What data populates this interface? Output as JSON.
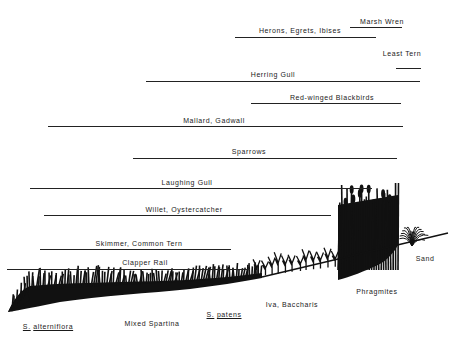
{
  "title": "",
  "birds": [
    {
      "name": "Marsh Wren",
      "x1": 350,
      "x2": 402,
      "y": 27,
      "label_x": 382,
      "label_y": 18
    },
    {
      "name": "Herons, Egrets, Ibises",
      "x1": 235,
      "x2": 376,
      "y": 37,
      "label_x": 300,
      "label_y": 27
    },
    {
      "name": "Least Tern",
      "x1": 396,
      "x2": 421,
      "y": 68,
      "label_x": 402,
      "label_y": 50
    },
    {
      "name": "Herring Gull",
      "x1": 146,
      "x2": 420,
      "y": 81,
      "label_x": 273,
      "label_y": 71
    },
    {
      "name": "Red-winged Blackbirds",
      "x1": 251,
      "x2": 401,
      "y": 103,
      "label_x": 332,
      "label_y": 94
    },
    {
      "name": "Mallard, Gadwall",
      "x1": 48,
      "x2": 403,
      "y": 126,
      "label_x": 214,
      "label_y": 117
    },
    {
      "name": "Sparrows",
      "x1": 133,
      "x2": 397,
      "y": 158,
      "label_x": 249,
      "label_y": 148
    },
    {
      "name": "Laughing Gull",
      "x1": 30,
      "x2": 372,
      "y": 188,
      "label_x": 187,
      "label_y": 179
    },
    {
      "name": "Willet, Oystercatcher",
      "x1": 44,
      "x2": 331,
      "y": 215,
      "label_x": 184,
      "label_y": 206
    },
    {
      "name": "Skimmer, Common Tern",
      "x1": 40,
      "x2": 231,
      "y": 249,
      "label_x": 139,
      "label_y": 240
    },
    {
      "name": "Clapper Rail",
      "x1": 7,
      "x2": 250,
      "y": 269,
      "label_x": 145,
      "label_y": 259
    }
  ],
  "zones": [
    {
      "name": "S. alterniflora",
      "genus": "S.",
      "species": "alterniflora",
      "x": 48,
      "y": 323,
      "underline": true
    },
    {
      "name": "Mixed Spartina",
      "x": 152,
      "y": 320,
      "underline": false
    },
    {
      "name": "S. patens",
      "genus": "S.",
      "species": "patens",
      "x": 224,
      "y": 311,
      "underline": true
    },
    {
      "name": "Iva, Baccharis",
      "x": 292,
      "y": 301,
      "underline": false
    },
    {
      "name": "Phragmites",
      "x": 377,
      "y": 288,
      "underline": false
    },
    {
      "name": "Sand",
      "x": 425,
      "y": 255,
      "underline": false
    }
  ],
  "colors": {
    "ink": "#111111",
    "line": "#222222",
    "background": "#ffffff"
  }
}
